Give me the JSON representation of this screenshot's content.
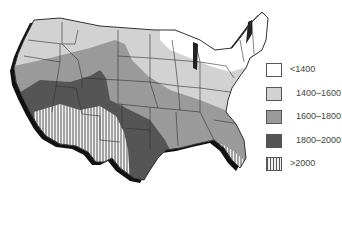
{
  "map": {
    "subject": "United States (contiguous) regional value bands",
    "colors": {
      "band_lt1400": "#ffffff",
      "band_1400_1600": "#d2d2d2",
      "band_1600_1800": "#9a9a9a",
      "band_1800_2000": "#555555",
      "band_gt2000": "hatched",
      "border": "#333333",
      "shadow": "#111111"
    }
  },
  "legend": {
    "items": [
      {
        "label": "<1400",
        "color": "#ffffff"
      },
      {
        "label": "1400–1600",
        "color": "#d2d2d2"
      },
      {
        "label": "1600–1800",
        "color": "#9a9a9a"
      },
      {
        "label": "1800–2000",
        "color": "#555555"
      },
      {
        "label": ">2000",
        "color": "hatched"
      }
    ]
  }
}
